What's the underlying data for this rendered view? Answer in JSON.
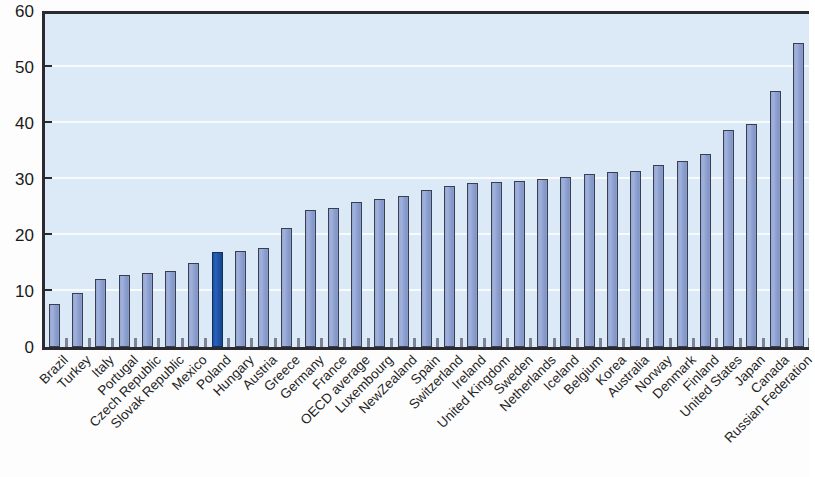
{
  "chart_data": {
    "type": "bar",
    "title": "",
    "subtitle": "",
    "xlabel": "",
    "ylabel": "",
    "ylim": [
      0,
      60
    ],
    "ytick_labels": [
      "0",
      "10",
      "20",
      "30",
      "40",
      "50",
      "60"
    ],
    "ytick_values": [
      0,
      10,
      20,
      30,
      40,
      50,
      60
    ],
    "grid": true,
    "legend": "none",
    "highlight_category": "Poland",
    "colors": {
      "bar": "#8fa2d0",
      "bar_border": "#3a3f50",
      "highlight_bar": "#1e54a8",
      "plot_background": "#dceaf7",
      "axis": "#2a2a30",
      "gridline": "#ffffff",
      "text": "#1f1f1f"
    },
    "categories": [
      "Brazil",
      "Turkey",
      "Italy",
      "Portugal",
      "Czech Republic",
      "Slovak Republic",
      "Mexico",
      "Poland",
      "Hungary",
      "Austria",
      "Greece",
      "Germany",
      "France",
      "OECD average",
      "Luxembourg",
      "NewZealand",
      "Spain",
      "Switzerland",
      "Ireland",
      "United Kingdom",
      "Sweden",
      "Netherlands",
      "Iceland",
      "Belgium",
      "Korea",
      "Australia",
      "Norway",
      "Denmark",
      "Finland",
      "United States",
      "Japan",
      "Canada",
      "Russian Federation"
    ],
    "values": [
      7.6,
      9.7,
      12.1,
      12.8,
      13.2,
      13.6,
      15.0,
      16.9,
      17.1,
      17.6,
      21.2,
      24.4,
      24.8,
      25.9,
      26.5,
      27.0,
      28.1,
      28.7,
      29.2,
      29.4,
      29.6,
      30.0,
      30.4,
      30.9,
      31.3,
      31.4,
      32.5,
      33.2,
      34.4,
      38.8,
      39.8,
      45.7,
      54.2
    ]
  }
}
